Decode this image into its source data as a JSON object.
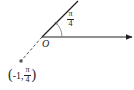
{
  "diagram": {
    "origin_label": "O",
    "angle_label": {
      "numerator": "π",
      "denominator": "4"
    },
    "point": {
      "r": "-1",
      "theta_numerator": "π",
      "theta_denominator": "4",
      "open_paren": "(",
      "comma": ",",
      "close_paren": ")"
    },
    "elements": {
      "polar_axis": {
        "from": [
          42,
          37
        ],
        "to": [
          133,
          37
        ],
        "arrow": true
      },
      "terminal_ray": {
        "from": [
          42,
          37
        ],
        "to": [
          78,
          1
        ],
        "angle": "π/4"
      },
      "dashed_extension": {
        "from": [
          42,
          37
        ],
        "to": [
          21,
          61
        ],
        "style": "dashed"
      },
      "point_dot": {
        "at": [
          21,
          61
        ]
      }
    },
    "colors": {
      "stroke": "#222222",
      "dashed": "#555555",
      "point": "#555555",
      "background": "#ffffff"
    }
  }
}
